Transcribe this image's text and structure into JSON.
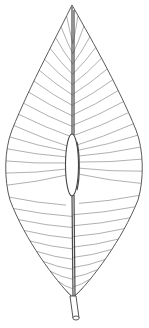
{
  "image": {
    "subject": "leaf line drawing",
    "width": 149,
    "height": 328,
    "colors": {
      "background": "#ffffff",
      "line": "#5a5a5a",
      "vein": "#7a7a7a"
    },
    "leaf": {
      "tip": [
        72,
        5
      ],
      "base": [
        73,
        298
      ],
      "widest_left": [
        5,
        165
      ],
      "widest_right": [
        142,
        165
      ],
      "swelling": {
        "cx": 72,
        "cy": 165,
        "rx": 6.5,
        "ry": 31
      },
      "petiole": {
        "from": [
          73,
          298
        ],
        "to": [
          75,
          320
        ]
      },
      "vein_count_per_side": 26
    }
  }
}
